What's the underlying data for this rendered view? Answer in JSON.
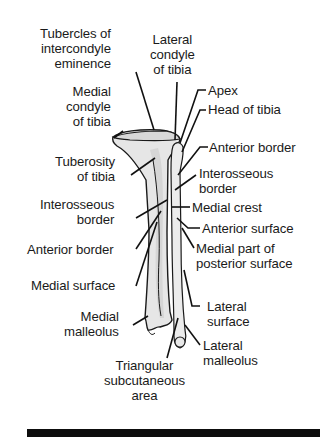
{
  "diagram": {
    "labels": {
      "tubercles": [
        "Tubercles of",
        "intercondyle",
        "eminence"
      ],
      "lateral_condyle": [
        "Lateral",
        "condyle",
        "of tibia"
      ],
      "medial_condyle": [
        "Medial",
        "condyle",
        "of tibia"
      ],
      "apex": "Apex",
      "head_of_tibia": "Head of tibia",
      "anterior_border_right": "Anterior border",
      "tuberosity": [
        "Tuberosity",
        "of tibia"
      ],
      "interosseous_border_right": [
        "Interosseous",
        "border"
      ],
      "interosseous_border_left": [
        "Interosseous",
        "border"
      ],
      "medial_crest": "Medial crest",
      "anterior_surface": "Anterior surface",
      "anterior_border_left": "Anterior border",
      "medial_part_posterior": [
        "Medial part of",
        "posterior surface"
      ],
      "medial_surface": "Medial surface",
      "medial_malleolus": [
        "Medial",
        "malleolus"
      ],
      "lateral_surface": [
        "Lateral",
        "surface"
      ],
      "lateral_malleolus": [
        "Lateral",
        "malleolus"
      ],
      "triangular_area": [
        "Triangular",
        "subcutaneous",
        "area"
      ]
    },
    "colors": {
      "ink": "#1a1a1a",
      "bone_fill": "#e4e4e4",
      "bone_shade": "#cfcfcf",
      "rule_bar": "#0d0d0d"
    }
  }
}
